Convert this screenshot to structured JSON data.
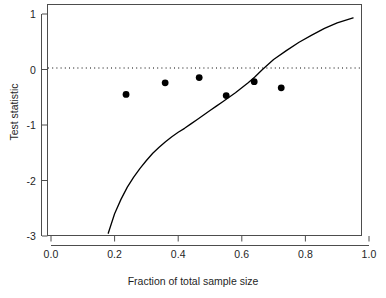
{
  "chart_data": {
    "type": "scatter",
    "title": "",
    "xlabel": "Fraction of total sample size",
    "ylabel": "Test statistic",
    "xlim": [
      0.0,
      1.0
    ],
    "ylim": [
      -3.0,
      1.0
    ],
    "grid": false,
    "legend": null,
    "x_ticks": [
      {
        "value": 0.0,
        "label": "0.0"
      },
      {
        "value": 0.2,
        "label": "0.2"
      },
      {
        "value": 0.4,
        "label": "0.4"
      },
      {
        "value": 0.6,
        "label": "0.6"
      },
      {
        "value": 0.8,
        "label": "0.8"
      },
      {
        "value": 1.0,
        "label": "1.0"
      }
    ],
    "y_ticks": [
      {
        "value": 1,
        "label": "1"
      },
      {
        "value": 0,
        "label": "0"
      },
      {
        "value": -1,
        "label": "-1"
      },
      {
        "value": -2,
        "label": "-2"
      },
      {
        "value": -3,
        "label": "-3"
      }
    ],
    "series": [
      {
        "name": "Observed test statistics",
        "type": "scatter",
        "marker": "filled-circle",
        "color": "#000000",
        "points": [
          {
            "x": 0.236,
            "y": -0.45
          },
          {
            "x": 0.359,
            "y": -0.24
          },
          {
            "x": 0.466,
            "y": -0.145
          },
          {
            "x": 0.551,
            "y": -0.47
          },
          {
            "x": 0.639,
            "y": -0.22
          },
          {
            "x": 0.724,
            "y": -0.33
          }
        ]
      },
      {
        "name": "Boundary curve",
        "type": "line",
        "color": "#000000",
        "points": [
          {
            "x": 0.18,
            "y": -2.95
          },
          {
            "x": 0.2,
            "y": -2.6
          },
          {
            "x": 0.22,
            "y": -2.34
          },
          {
            "x": 0.24,
            "y": -2.12
          },
          {
            "x": 0.26,
            "y": -1.94
          },
          {
            "x": 0.28,
            "y": -1.78
          },
          {
            "x": 0.3,
            "y": -1.64
          },
          {
            "x": 0.32,
            "y": -1.51
          },
          {
            "x": 0.34,
            "y": -1.4
          },
          {
            "x": 0.36,
            "y": -1.3
          },
          {
            "x": 0.38,
            "y": -1.21
          },
          {
            "x": 0.4,
            "y": -1.13
          },
          {
            "x": 0.42,
            "y": -1.06
          },
          {
            "x": 0.44,
            "y": -0.98
          },
          {
            "x": 0.46,
            "y": -0.9
          },
          {
            "x": 0.48,
            "y": -0.82
          },
          {
            "x": 0.5,
            "y": -0.74
          },
          {
            "x": 0.52,
            "y": -0.66
          },
          {
            "x": 0.54,
            "y": -0.58
          },
          {
            "x": 0.56,
            "y": -0.5
          },
          {
            "x": 0.58,
            "y": -0.42
          },
          {
            "x": 0.6,
            "y": -0.33
          },
          {
            "x": 0.62,
            "y": -0.24
          },
          {
            "x": 0.64,
            "y": -0.14
          },
          {
            "x": 0.665,
            "y": 0.0
          },
          {
            "x": 0.7,
            "y": 0.18
          },
          {
            "x": 0.74,
            "y": 0.34
          },
          {
            "x": 0.78,
            "y": 0.49
          },
          {
            "x": 0.82,
            "y": 0.62
          },
          {
            "x": 0.86,
            "y": 0.74
          },
          {
            "x": 0.9,
            "y": 0.84
          },
          {
            "x": 0.95,
            "y": 0.93
          }
        ]
      },
      {
        "name": "Zero reference line",
        "type": "hline",
        "style": "dotted",
        "color": "#000000",
        "y": 0
      }
    ]
  }
}
